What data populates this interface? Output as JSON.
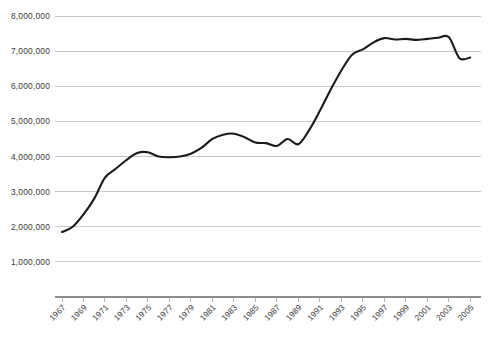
{
  "chart_data": {
    "type": "line",
    "title": "",
    "subtitle": "",
    "xlabel": "",
    "ylabel": "",
    "grid": "horizontal",
    "legend": "none",
    "xlim": [
      1967,
      2006
    ],
    "ylim": [
      0,
      8000000
    ],
    "y_ticks": [
      1000000,
      2000000,
      3000000,
      4000000,
      5000000,
      6000000,
      7000000,
      8000000
    ],
    "y_tick_labels": [
      "1,000,000",
      "2,000,000",
      "3,000,000",
      "4,000,000",
      "5,000,000",
      "6,000,000",
      "7,000,000",
      "8,000,000"
    ],
    "x_ticks": [
      1967,
      1969,
      1971,
      1973,
      1975,
      1977,
      1979,
      1981,
      1983,
      1985,
      1987,
      1989,
      1991,
      1993,
      1995,
      1997,
      1999,
      2001,
      2003,
      2005
    ],
    "x_tick_labels": [
      "1967",
      "1969",
      "1971",
      "1973",
      "1975",
      "1977",
      "1979",
      "1981",
      "1983",
      "1985",
      "1987",
      "1989",
      "1991",
      "1993",
      "1995",
      "1997",
      "1999",
      "2001",
      "2003",
      "2005"
    ],
    "series": [
      {
        "name": "Series 1",
        "color": "#1a1a1a",
        "x": [
          1967,
          1968,
          1969,
          1970,
          1971,
          1972,
          1973,
          1974,
          1975,
          1976,
          1977,
          1978,
          1979,
          1980,
          1981,
          1982,
          1983,
          1984,
          1985,
          1986,
          1987,
          1988,
          1989,
          1990,
          1991,
          1992,
          1993,
          1994,
          1995,
          1996,
          1997,
          1998,
          1999,
          2000,
          2001,
          2002,
          2003,
          2004,
          2005
        ],
        "values": [
          1850000,
          2000000,
          2350000,
          2800000,
          3400000,
          3650000,
          3900000,
          4100000,
          4120000,
          4000000,
          3980000,
          4000000,
          4080000,
          4250000,
          4500000,
          4620000,
          4650000,
          4550000,
          4400000,
          4380000,
          4300000,
          4500000,
          4350000,
          4750000,
          5300000,
          5900000,
          6450000,
          6900000,
          7050000,
          7250000,
          7370000,
          7330000,
          7350000,
          7320000,
          7350000,
          7380000,
          7400000,
          6800000,
          6820000
        ]
      }
    ],
    "annotations": []
  },
  "colors": {
    "line": "#1a1a1a",
    "gridline": "#c9c9c9",
    "axis": "#8d8d8d",
    "tick_label": "#3a3a3a",
    "background": "#ffffff"
  },
  "geometry": {
    "plot_left": 62,
    "plot_right": 481,
    "plot_top": 16,
    "plot_bottom": 297
  }
}
